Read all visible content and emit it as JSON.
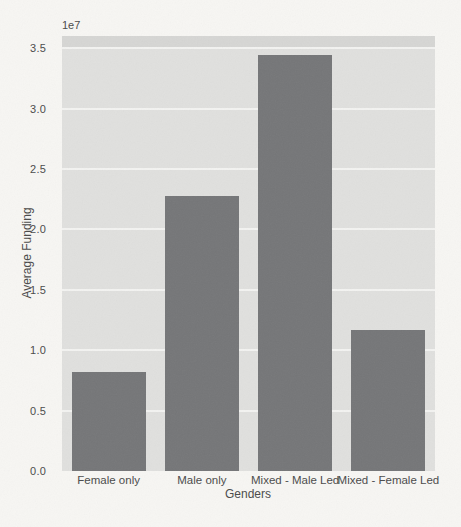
{
  "chart_data": {
    "type": "bar",
    "title": "",
    "xlabel": "Genders",
    "ylabel": "Average Funding",
    "offset_text": "1e7",
    "categories": [
      "Female only",
      "Male only",
      "Mixed - Male Led",
      "Mixed - Female Led"
    ],
    "values": [
      8200000,
      22800000,
      34400000,
      11700000
    ],
    "ylim": [
      0,
      36000000
    ],
    "ytick_values": [
      0.0,
      5000000,
      10000000,
      15000000,
      20000000,
      25000000,
      30000000,
      35000000
    ],
    "ytick_labels": [
      "0.0",
      "0.5",
      "1.0",
      "1.5",
      "2.0",
      "2.5",
      "3.0",
      "3.5"
    ],
    "grid": true,
    "legend": false,
    "bar_color": "#757678",
    "plot_bg": "#e0e0de",
    "grid_color": "#f3f3f1",
    "paper_color": "#f7f6f3"
  }
}
